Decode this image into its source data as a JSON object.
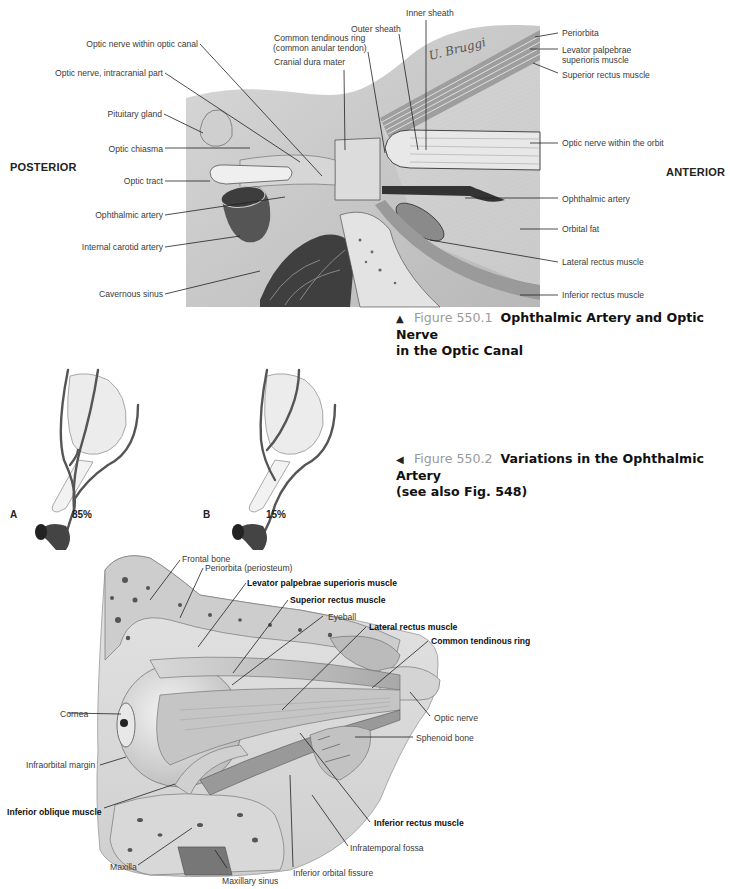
{
  "figure_550_1": {
    "orientation": {
      "left": "POSTERIOR",
      "right": "ANTERIOR"
    },
    "labels_left": [
      "Optic nerve within optic canal",
      "Optic nerve, intracranial part",
      "Pituitary gland",
      "Optic chiasma",
      "Optic tract",
      "Ophthalmic artery",
      "Internal carotid artery",
      "Cavernous sinus"
    ],
    "labels_top": [
      "Inner sheath",
      "Outer sheath",
      "Common tendinous ring",
      "(common anular tendon)",
      "Cranial dura mater"
    ],
    "labels_right": [
      "Periorbita",
      "Levator palpebrae",
      "superioris muscle",
      "Superior rectus muscle",
      "Optic nerve within the orbit",
      "Ophthalmic artery",
      "Orbital fat",
      "Lateral rectus muscle",
      "Inferior rectus muscle"
    ],
    "signature": "U. Bruggi",
    "caption": {
      "arrow": "▲",
      "figure_number": "Figure 550.1",
      "title_line1": "Ophthalmic Artery and Optic Nerve",
      "title_line2": "in the Optic Canal"
    }
  },
  "figure_550_2": {
    "variants": [
      {
        "letter": "A",
        "percent": "85%"
      },
      {
        "letter": "B",
        "percent": "15%"
      }
    ],
    "caption": {
      "arrow": "◀",
      "figure_number": "Figure 550.2",
      "title_line1": "Variations in the Ophthalmic Artery",
      "title_line2": "(see also Fig. 548)"
    }
  },
  "figure_550_3": {
    "labels": {
      "frontal_bone": "Frontal bone",
      "periorbita": "Periorbita (periosteum)",
      "levator": "Levator palpebrae superioris muscle",
      "superior_rectus": "Superior rectus muscle",
      "eyeball": "Eyeball",
      "lateral_rectus": "Lateral rectus muscle",
      "common_tendinous_ring": "Common tendinous ring",
      "cornea": "Cornea",
      "optic_nerve": "Optic nerve",
      "sphenoid_bone": "Sphenoid bone",
      "infraorbital_margin": "Infraorbital margin",
      "inferior_oblique": "Inferior oblique muscle",
      "inferior_rectus": "Inferior rectus muscle",
      "infratemporal_fossa": "Infratemporal fossa",
      "maxilla": "Maxilla",
      "inferior_orbital_fissure": "Inferior orbital fissure",
      "maxillary_sinus": "Maxillary sinus"
    }
  }
}
